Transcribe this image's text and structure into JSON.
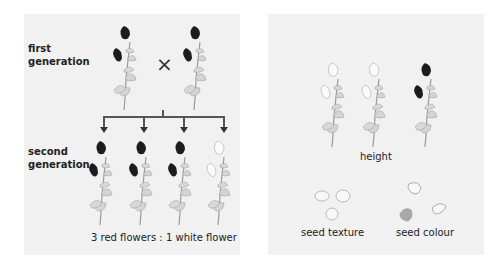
{
  "left_panel": {
    "first_generation_label": [
      "first",
      "generation"
    ],
    "cross_symbol": "×",
    "second_generation_label": [
      "second",
      "generation"
    ],
    "ratio_caption": "3 red flowers : 1 white flower",
    "first_generation_plants": [
      {
        "flower_color": "red"
      },
      {
        "flower_color": "red"
      }
    ],
    "second_generation_plants": [
      {
        "flower_color": "red"
      },
      {
        "flower_color": "red"
      },
      {
        "flower_color": "red"
      },
      {
        "flower_color": "white"
      }
    ]
  },
  "right_panel": {
    "height_caption": "height",
    "seed_texture_caption": "seed texture",
    "seed_colour_caption": "seed colour",
    "height_plants": [
      {
        "flower_color": "white",
        "size": "short"
      },
      {
        "flower_color": "white",
        "size": "tall"
      },
      {
        "flower_color": "red",
        "size": "short"
      }
    ]
  },
  "colors": {
    "panel_bg": "#f1f1f1",
    "red_flower": "#1c1c1c",
    "white_flower": "#fbfbfb",
    "leaf": "#d4d4d4",
    "stem": "#9a9a9a",
    "arrow": "#555555",
    "wrinkled_seed": "#a9a9a9"
  }
}
